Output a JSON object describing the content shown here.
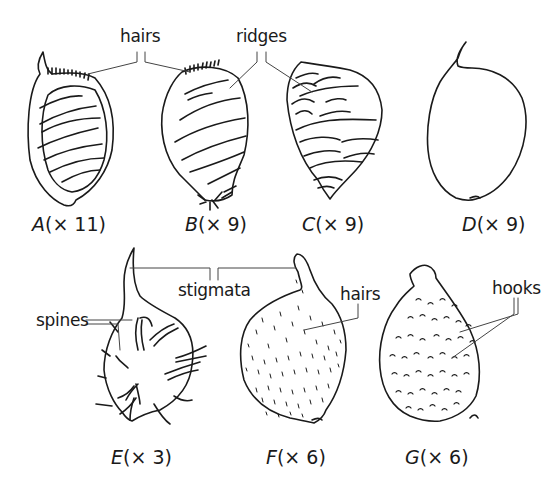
{
  "diagram": {
    "annotations": {
      "hairs_top": "hairs",
      "ridges": "ridges",
      "stigmata": "stigmata",
      "spines": "spines",
      "hairs_F": "hairs",
      "hooks": "hooks"
    },
    "fruits": [
      {
        "letter": "A",
        "magnification": "(× 11)"
      },
      {
        "letter": "B",
        "magnification": "(× 9)"
      },
      {
        "letter": "C",
        "magnification": "(× 9)"
      },
      {
        "letter": "D",
        "magnification": "(× 9)"
      },
      {
        "letter": "E",
        "magnification": "(× 3)"
      },
      {
        "letter": "F",
        "magnification": "(× 6)"
      },
      {
        "letter": "G",
        "magnification": "(× 6)"
      }
    ]
  }
}
